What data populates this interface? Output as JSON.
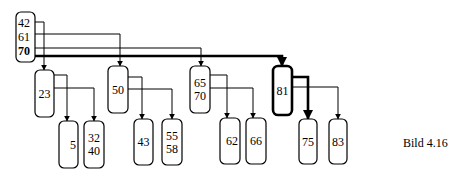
{
  "caption": "Bild 4.16",
  "colors": {
    "stroke": "#000000",
    "background": "#ffffff"
  },
  "diagram": {
    "type": "b-tree-search-path",
    "nodes": [
      {
        "id": "root",
        "keys": [
          "42",
          "61",
          "70"
        ],
        "bold_key": 2,
        "x": 16,
        "y": 12,
        "w": 19,
        "h": 50,
        "bold": false,
        "key_align": "start"
      },
      {
        "id": "n23",
        "keys": [
          "23"
        ],
        "x": 35,
        "y": 70,
        "w": 19,
        "h": 47,
        "bold": false
      },
      {
        "id": "n50",
        "keys": [
          "50"
        ],
        "x": 108,
        "y": 66,
        "w": 20,
        "h": 47,
        "bold": false
      },
      {
        "id": "n65",
        "keys": [
          "65",
          "70"
        ],
        "x": 190,
        "y": 66,
        "w": 20,
        "h": 47,
        "bold": false
      },
      {
        "id": "n81",
        "keys": [
          "81"
        ],
        "x": 273,
        "y": 66,
        "w": 19,
        "h": 49,
        "bold": true
      },
      {
        "id": "n5",
        "keys": [
          "5"
        ],
        "x": 59,
        "y": 121,
        "w": 19,
        "h": 47,
        "bold": false,
        "key_align": "end"
      },
      {
        "id": "n32",
        "keys": [
          "32",
          "40"
        ],
        "x": 84,
        "y": 121,
        "w": 20,
        "h": 47,
        "bold": false
      },
      {
        "id": "n43",
        "keys": [
          "43"
        ],
        "x": 134,
        "y": 119,
        "w": 19,
        "h": 46,
        "bold": false
      },
      {
        "id": "n55",
        "keys": [
          "55",
          "58"
        ],
        "x": 162,
        "y": 119,
        "w": 20,
        "h": 46,
        "bold": false
      },
      {
        "id": "n62",
        "keys": [
          "62"
        ],
        "x": 220,
        "y": 118,
        "w": 20,
        "h": 46,
        "bold": false,
        "key_align": "end"
      },
      {
        "id": "n66",
        "keys": [
          "66"
        ],
        "x": 246,
        "y": 118,
        "w": 20,
        "h": 46,
        "bold": false
      },
      {
        "id": "n75",
        "keys": [
          "75"
        ],
        "x": 299,
        "y": 119,
        "w": 18,
        "h": 45,
        "bold": false
      },
      {
        "id": "n83",
        "keys": [
          "83"
        ],
        "x": 329,
        "y": 119,
        "w": 18,
        "h": 45,
        "bold": false
      }
    ],
    "edges": [
      {
        "from": "root",
        "to": "n23",
        "points": [
          [
            35,
            22
          ],
          [
            44,
            22
          ],
          [
            44,
            70
          ]
        ],
        "bold": false
      },
      {
        "from": "root",
        "to": "n50",
        "points": [
          [
            35,
            34
          ],
          [
            120,
            34
          ],
          [
            120,
            66
          ]
        ],
        "bold": false
      },
      {
        "from": "root",
        "to": "n65",
        "points": [
          [
            35,
            48
          ],
          [
            201,
            48
          ],
          [
            201,
            66
          ]
        ],
        "bold": false
      },
      {
        "from": "root",
        "to": "n81",
        "points": [
          [
            35,
            56
          ],
          [
            282,
            56
          ],
          [
            282,
            66
          ]
        ],
        "bold": true
      },
      {
        "from": "n23",
        "to": "n5",
        "points": [
          [
            54,
            75
          ],
          [
            67,
            75
          ],
          [
            67,
            121
          ]
        ],
        "bold": false
      },
      {
        "from": "n23",
        "to": "n32",
        "points": [
          [
            54,
            88
          ],
          [
            94,
            88
          ],
          [
            94,
            121
          ]
        ],
        "bold": false
      },
      {
        "from": "n50",
        "to": "n43",
        "points": [
          [
            128,
            77
          ],
          [
            142,
            77
          ],
          [
            142,
            119
          ]
        ],
        "bold": false
      },
      {
        "from": "n50",
        "to": "n55",
        "points": [
          [
            128,
            89
          ],
          [
            172,
            89
          ],
          [
            172,
            119
          ]
        ],
        "bold": false
      },
      {
        "from": "n65",
        "to": "n62",
        "points": [
          [
            210,
            75
          ],
          [
            227,
            75
          ],
          [
            227,
            118
          ]
        ],
        "bold": false
      },
      {
        "from": "n65",
        "to": "n66",
        "points": [
          [
            210,
            88
          ],
          [
            253,
            88
          ],
          [
            253,
            118
          ]
        ],
        "bold": false
      },
      {
        "from": "n81",
        "to": "n75",
        "points": [
          [
            292,
            77
          ],
          [
            308,
            77
          ],
          [
            308,
            119
          ]
        ],
        "bold": true
      },
      {
        "from": "n81",
        "to": "n83",
        "points": [
          [
            292,
            87
          ],
          [
            338,
            87
          ],
          [
            338,
            119
          ]
        ],
        "bold": false
      }
    ]
  }
}
